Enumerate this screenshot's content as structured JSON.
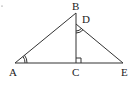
{
  "figure": {
    "type": "geometry-diagram",
    "points": {
      "A": {
        "label": "A"
      },
      "B": {
        "label": "B"
      },
      "C": {
        "label": "C"
      },
      "D": {
        "label": "D"
      },
      "E": {
        "label": "E"
      }
    },
    "segments": [
      "AB",
      "AE",
      "BC",
      "DE"
    ],
    "marks": [
      {
        "type": "double-arc-angle",
        "at": "A",
        "angle": "BAC"
      },
      {
        "type": "double-arc-angle",
        "at": "D",
        "angle": "CDE"
      },
      {
        "type": "right-angle",
        "at": "C",
        "angle": "BCE"
      }
    ],
    "colors": {
      "stroke": "#333333",
      "text": "#222222",
      "background": "#ffffff"
    }
  }
}
